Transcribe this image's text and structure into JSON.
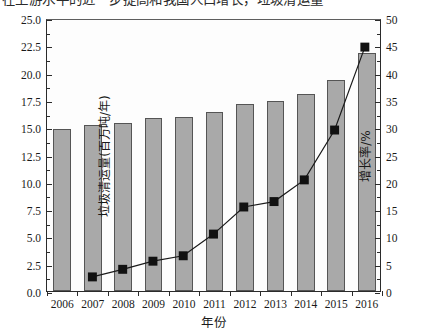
{
  "top_cutoff_text": "在上游水平的近一步提高和我国人口增长，垃圾清运量",
  "axes": {
    "xlabel": "年份",
    "ylabel_left": "垃圾清运量(百万吨/年)",
    "ylabel_right": "增长率/%",
    "y_left_ticks": [
      "0.0",
      "2.5",
      "5.0",
      "7.5",
      "10.0",
      "12.5",
      "15.0",
      "17.5",
      "20.0",
      "22.5",
      "25.0"
    ],
    "y_right_ticks": [
      "0",
      "5",
      "10",
      "15",
      "20",
      "25",
      "30",
      "35",
      "40",
      "45",
      "50"
    ]
  },
  "colors": {
    "bar_fill": "#a9a9a9",
    "bar_edge": "#555555",
    "line": "#1a1a1a",
    "marker": "#111111",
    "axis": "#2b2b2b",
    "background": "#ffffff"
  },
  "chart_data": {
    "type": "bar",
    "title": "",
    "xlabel": "年份",
    "ylabel": "垃圾清运量(百万吨/年)",
    "ylabel_secondary": "增长率/%",
    "categories": [
      "2006",
      "2007",
      "2008",
      "2009",
      "2010",
      "2011",
      "2012",
      "2013",
      "2014",
      "2015",
      "2016"
    ],
    "ylim": [
      0,
      25
    ],
    "ylim_secondary": [
      0,
      50
    ],
    "grid": false,
    "legend": "none",
    "series": [
      {
        "name": "垃圾清运量(百万吨/年)",
        "type": "bar",
        "axis": "left",
        "values": [
          14.8,
          15.2,
          15.4,
          15.8,
          15.9,
          16.4,
          17.1,
          17.4,
          18.0,
          19.3,
          21.8
        ]
      },
      {
        "name": "增长率/%",
        "type": "line",
        "axis": "right",
        "marker": "square",
        "values": [
          null,
          2.6,
          4.0,
          5.5,
          6.5,
          10.5,
          15.5,
          16.5,
          20.5,
          29.7,
          45.0
        ]
      }
    ]
  }
}
